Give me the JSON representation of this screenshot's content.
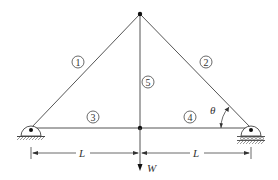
{
  "diagram": {
    "type": "truss",
    "nodes": {
      "left_support": {
        "x": 31,
        "y": 128
      },
      "center_bottom": {
        "x": 140,
        "y": 128
      },
      "right_support": {
        "x": 251,
        "y": 128
      },
      "top": {
        "x": 140,
        "y": 14
      }
    },
    "members": [
      {
        "id": "1",
        "label": "1",
        "label_pos": {
          "x": 78,
          "y": 62
        }
      },
      {
        "id": "2",
        "label": "2",
        "label_pos": {
          "x": 206,
          "y": 62
        }
      },
      {
        "id": "3",
        "label": "3",
        "label_pos": {
          "x": 93,
          "y": 117
        }
      },
      {
        "id": "4",
        "label": "4",
        "label_pos": {
          "x": 190,
          "y": 117
        }
      },
      {
        "id": "5",
        "label": "5",
        "label_pos": {
          "x": 148,
          "y": 82
        }
      }
    ],
    "angle_label": "θ",
    "dimensions": [
      {
        "label": "L"
      },
      {
        "label": "L"
      }
    ],
    "load_label": "W",
    "supports": {
      "left": "pin",
      "right": "roller"
    }
  }
}
